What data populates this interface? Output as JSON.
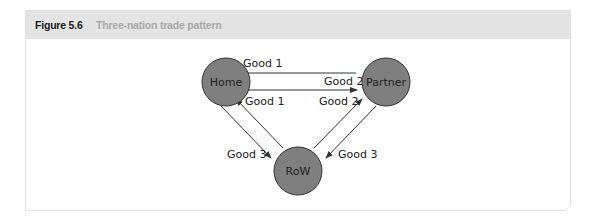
{
  "figure": {
    "number": "Figure 5.6",
    "title": "Three-nation trade pattern"
  },
  "colors": {
    "node_fill": "#7f7f7f",
    "node_stroke": "#333333",
    "arrow": "#333333",
    "header_bg": "#e4e4e4"
  },
  "nodes": [
    {
      "id": "home",
      "label": "Home"
    },
    {
      "id": "partner",
      "label": "Partner"
    },
    {
      "id": "row",
      "label": "RoW"
    }
  ],
  "edges": [
    {
      "from": "partner",
      "to": "home",
      "label": "Good 1"
    },
    {
      "from": "home",
      "to": "partner",
      "label": "Good 2"
    },
    {
      "from": "row",
      "to": "home",
      "label": "Good 1"
    },
    {
      "from": "row",
      "to": "partner",
      "label": "Good 2"
    },
    {
      "from": "home",
      "to": "row",
      "label": "Good 3"
    },
    {
      "from": "partner",
      "to": "row",
      "label": "Good 3"
    }
  ]
}
